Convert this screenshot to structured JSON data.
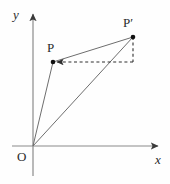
{
  "figure": {
    "background_color": "#fefefe",
    "axis_color": "#7d7d7d",
    "line_color": "#6e6e6e",
    "dash_color": "#2f2f2f",
    "point_color": "#111111",
    "text_color": "#2b2b2b",
    "width": 170,
    "height": 184
  },
  "labels": {
    "y_axis": "y",
    "x_axis": "x",
    "origin": "O",
    "point_p": "P",
    "point_p_prime": "P′"
  },
  "chart_data": {
    "type": "scatter",
    "title": "",
    "xlabel": "x",
    "ylabel": "y",
    "grid": false,
    "legend": null,
    "axes": {
      "origin_px": [
        33,
        146
      ],
      "x_axis_start_px": [
        12,
        146
      ],
      "x_axis_end_px": [
        161,
        146
      ],
      "y_axis_top_px": [
        33,
        11
      ],
      "y_axis_bottom_px": [
        33,
        176
      ],
      "x_arrow": true,
      "y_arrow": true
    },
    "points": [
      {
        "name": "O",
        "px": [
          33,
          146
        ],
        "marker": "none",
        "label_px": [
          17,
          150
        ]
      },
      {
        "name": "P",
        "px": [
          53,
          62
        ],
        "marker": "dot",
        "label_px": [
          47,
          41
        ]
      },
      {
        "name": "P′",
        "px": [
          133,
          37
        ],
        "marker": "dot",
        "label_px": [
          123,
          16
        ]
      }
    ],
    "segments": [
      {
        "name": "O-to-P",
        "from": [
          33,
          146
        ],
        "to": [
          53,
          62
        ],
        "style": "solid",
        "arrow": "none"
      },
      {
        "name": "O-to-P-prime",
        "from": [
          33,
          146
        ],
        "to": [
          133,
          37
        ],
        "style": "solid",
        "arrow": "none"
      },
      {
        "name": "P-to-P-prime",
        "from": [
          53,
          62
        ],
        "to": [
          133,
          37
        ],
        "style": "solid",
        "arrow": "none"
      },
      {
        "name": "P-prime-vertical-drop",
        "from": [
          133,
          37
        ],
        "to": [
          133,
          62
        ],
        "style": "dashed",
        "arrow": "none"
      },
      {
        "name": "horizontal-dashed-to-P",
        "from": [
          133,
          62
        ],
        "to": [
          57,
          62
        ],
        "style": "dashed",
        "arrow": "end"
      }
    ]
  }
}
